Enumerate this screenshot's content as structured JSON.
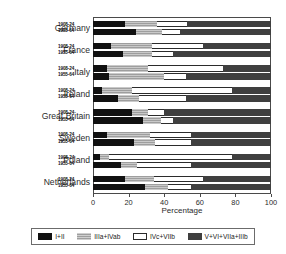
{
  "chart_data": {
    "type": "bar",
    "orientation": "horizontal",
    "stacked": true,
    "stack_total": 100,
    "title": "",
    "xlabel": "Percentage",
    "ylabel": "",
    "xlim": [
      0,
      100
    ],
    "xticks": [
      0,
      20,
      40,
      60,
      80,
      100
    ],
    "xtick_labels": [
      "0",
      "20",
      "40",
      "60",
      "80",
      "100"
    ],
    "grid": false,
    "legend_position": "bottom",
    "categories": [
      "Germany",
      "France",
      "Italy",
      "Ireland",
      "Great Britain",
      "Sweden",
      "Poland",
      "Netherlands"
    ],
    "periods": [
      "1908-24",
      "1955-64"
    ],
    "series": [
      {
        "name": "I+II",
        "color": "#111111"
      },
      {
        "name": "IIIa+IVab",
        "color": "#b4b4b4"
      },
      {
        "name": "IVc+VIIb",
        "color": "#ffffff"
      },
      {
        "name": "V+VI+VIIa+IIIb",
        "color": "#3f3f3f"
      }
    ],
    "rows": [
      {
        "country": "Germany",
        "period": "1908-24",
        "values": [
          18,
          18,
          17,
          47
        ]
      },
      {
        "country": "Germany",
        "period": "1955-64",
        "values": [
          24,
          15,
          10,
          51
        ]
      },
      {
        "country": "France",
        "period": "1908-24",
        "values": [
          10,
          23,
          29,
          38
        ]
      },
      {
        "country": "France",
        "period": "1955-64",
        "values": [
          17,
          16,
          12,
          55
        ]
      },
      {
        "country": "Italy",
        "period": "1908-24",
        "values": [
          8,
          23,
          42,
          27
        ]
      },
      {
        "country": "Italy",
        "period": "1955-64",
        "values": [
          9,
          31,
          12,
          48
        ]
      },
      {
        "country": "Ireland",
        "period": "1908-24",
        "values": [
          5,
          17,
          56,
          22
        ]
      },
      {
        "country": "Ireland",
        "period": "1955-64",
        "values": [
          14,
          12,
          26,
          48
        ]
      },
      {
        "country": "Great Britain",
        "period": "1908-24",
        "values": [
          22,
          9,
          9,
          60
        ]
      },
      {
        "country": "Great Britain",
        "period": "1955-64",
        "values": [
          28,
          10,
          7,
          55
        ]
      },
      {
        "country": "Sweden",
        "period": "1908-24",
        "values": [
          8,
          24,
          23,
          45
        ]
      },
      {
        "country": "Sweden",
        "period": "1955-64",
        "values": [
          23,
          12,
          20,
          45
        ]
      },
      {
        "country": "Poland",
        "period": "1908-24",
        "values": [
          4,
          5,
          69,
          22
        ]
      },
      {
        "country": "Poland",
        "period": "1955-64",
        "values": [
          16,
          9,
          30,
          45
        ]
      },
      {
        "country": "Netherlands",
        "period": "1908-24",
        "values": [
          18,
          16,
          28,
          38
        ]
      },
      {
        "country": "Netherlands",
        "period": "1955-64",
        "values": [
          29,
          13,
          13,
          45
        ]
      }
    ]
  },
  "axis": {
    "xlabel": "Percentage",
    "ticks": [
      "0",
      "20",
      "40",
      "60",
      "80",
      "100"
    ]
  },
  "legend": {
    "items": [
      {
        "label": "I+II"
      },
      {
        "label": "IIIa+IVab"
      },
      {
        "label": "IVc+VIIb"
      },
      {
        "label": "V+VI+VIIa+IIIb"
      }
    ]
  }
}
